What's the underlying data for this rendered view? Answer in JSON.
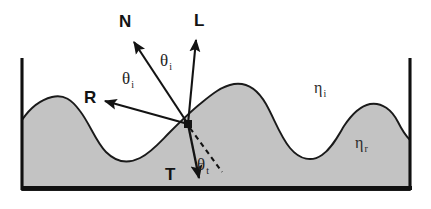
{
  "figure": {
    "kind": "optics-reflection-refraction-diagram",
    "background_color": "#ffffff",
    "surface_fill_color": "#c3c3c3",
    "surface_stroke_color": "#1a1a1a",
    "frame_color": "#101010",
    "vector_color": "#131313"
  },
  "vectors": [
    {
      "id": "normal",
      "label": "N",
      "label_x": 119,
      "label_y": 27,
      "x1": 188,
      "y1": 124,
      "x2": 134,
      "y2": 42
    },
    {
      "id": "light",
      "label": "L",
      "label_x": 194,
      "label_y": 26,
      "x1": 188,
      "y1": 124,
      "x2": 196,
      "y2": 40
    },
    {
      "id": "reflection",
      "label": "R",
      "label_x": 84,
      "label_y": 103,
      "x1": 188,
      "y1": 124,
      "x2": 105,
      "y2": 101
    },
    {
      "id": "transmission",
      "label": "T",
      "label_x": 165,
      "label_y": 180,
      "x1": 188,
      "y1": 124,
      "x2": 199,
      "y2": 178
    }
  ],
  "dashed_line": {
    "id": "normal-extension",
    "x1": 190,
    "y1": 128,
    "x2": 222,
    "y2": 172
  },
  "angles": [
    {
      "id": "theta-incident-left",
      "symbol": "θ",
      "subscript": "i",
      "x": 122,
      "y": 84
    },
    {
      "id": "theta-incident-right",
      "symbol": "θ",
      "subscript": "i",
      "x": 160,
      "y": 66
    },
    {
      "id": "theta-transmitted",
      "symbol": "θ",
      "subscript": "t",
      "x": 197,
      "y": 170
    }
  ],
  "media": [
    {
      "id": "incident-medium",
      "symbol": "η",
      "subscript": "i",
      "x": 314,
      "y": 93
    },
    {
      "id": "refractive-medium",
      "symbol": "η",
      "subscript": "r",
      "x": 355,
      "y": 148
    }
  ],
  "frame": {
    "left_wall": {
      "x": 22,
      "y1": 58,
      "y2": 190
    },
    "right_wall": {
      "x": 410,
      "y1": 58,
      "y2": 190
    },
    "baseline": {
      "x1": 22,
      "x2": 412,
      "y": 188
    }
  },
  "surface": {
    "path": "M 22,190 L 22,120 C 30,108 40,100 52,97 C 64,94 72,100 80,111 C 90,124 96,142 106,152 C 116,162 128,164 140,158 C 152,152 160,142 170,132 C 180,122 190,112 200,104 C 212,94 222,86 234,84 C 248,82 258,90 266,104 C 274,118 280,136 290,148 C 300,160 312,162 322,155 C 332,148 338,136 344,126 C 352,114 360,106 370,104 C 382,102 392,110 398,122 C 402,130 406,136 410,140 L 410,190 Z"
  }
}
